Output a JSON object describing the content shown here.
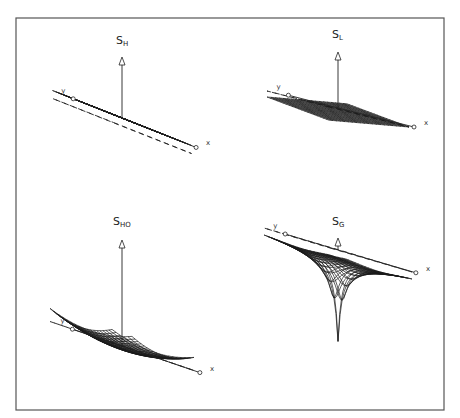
{
  "figure": {
    "panels": [
      {
        "id": "SH",
        "label_main": "S",
        "label_sub": "H",
        "surface": "flat",
        "description": "horizontal plane",
        "axes": {
          "x": "x",
          "y": "y"
        }
      },
      {
        "id": "SL",
        "label_main": "S",
        "label_sub": "L",
        "surface": "tilted",
        "description": "inclined plane",
        "axes": {
          "x": "x",
          "y": "y"
        }
      },
      {
        "id": "SHO",
        "label_main": "S",
        "label_sub": "HO",
        "surface": "paraboloid",
        "description": "bowl (harmonic oscillator)",
        "axes": {
          "x": "x",
          "y": "y"
        }
      },
      {
        "id": "SG",
        "label_main": "S",
        "label_sub": "G",
        "surface": "gravity-well",
        "description": "funnel (gravitational well)",
        "axes": {
          "x": "x",
          "y": "y"
        }
      }
    ],
    "grid_lines": 20
  }
}
